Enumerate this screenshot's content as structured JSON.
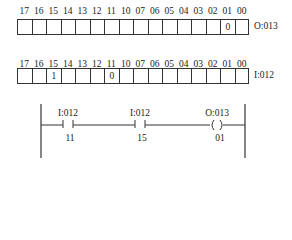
{
  "bit_numbers": [
    "17",
    "16",
    "15",
    "14",
    "13",
    "12",
    "11",
    "10",
    "07",
    "06",
    "05",
    "04",
    "03",
    "02",
    "01",
    "00"
  ],
  "output_table": {
    "address": "O:013",
    "values": [
      "",
      "",
      "",
      "",
      "",
      "",
      "",
      "",
      "",
      "",
      "",
      "",
      "",
      "",
      "0",
      ""
    ]
  },
  "input_table": {
    "address": "I:012",
    "values": [
      "",
      "",
      "1",
      "",
      "",
      "",
      "0",
      "",
      "",
      "",
      "",
      "",
      "",
      "",
      "",
      ""
    ]
  },
  "rung": {
    "contact1": {
      "address": "I:012",
      "bit": "11",
      "type": "XIC"
    },
    "contact2": {
      "address": "I:012",
      "bit": "15",
      "type": "XIC"
    },
    "coil": {
      "address": "O:013",
      "bit": "01",
      "type": "OTE"
    }
  }
}
